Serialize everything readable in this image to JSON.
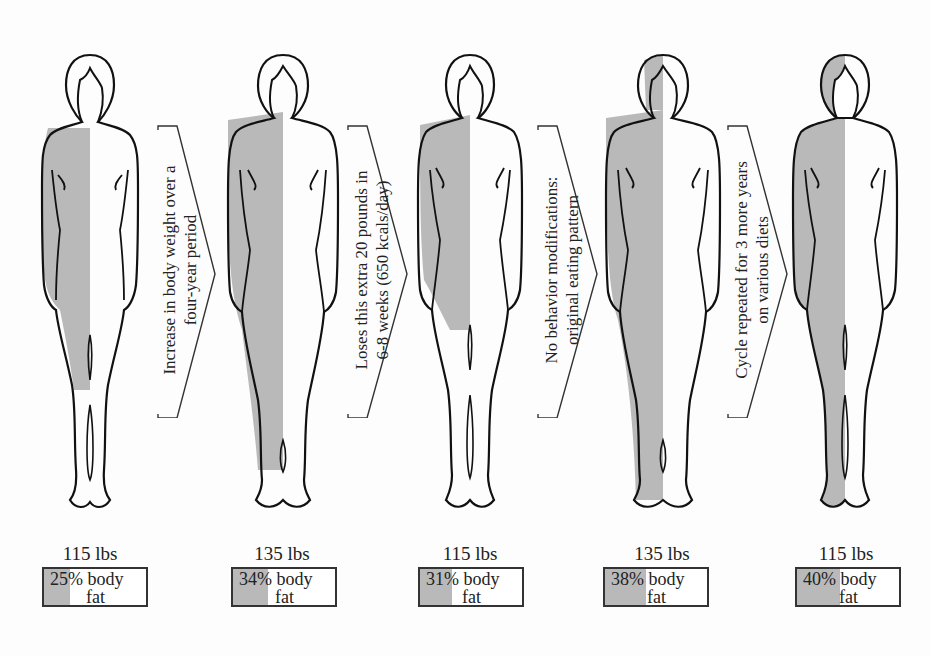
{
  "figures": [
    {
      "weight": "115 lbs",
      "fat_label_line1": "25% body",
      "fat_label_line2": "fat",
      "body_fat_pct": 25
    },
    {
      "weight": "135 lbs",
      "fat_label_line1": "34% body",
      "fat_label_line2": "fat",
      "body_fat_pct": 34
    },
    {
      "weight": "115 lbs",
      "fat_label_line1": "31% body",
      "fat_label_line2": "fat",
      "body_fat_pct": 31
    },
    {
      "weight": "135 lbs",
      "fat_label_line1": "38% body",
      "fat_label_line2": "fat",
      "body_fat_pct": 38
    },
    {
      "weight": "115 lbs",
      "fat_label_line1": "40% body",
      "fat_label_line2": "fat",
      "body_fat_pct": 40
    }
  ],
  "arrows": [
    {
      "line1": "Increase in body weight over a",
      "line2": "four-year period"
    },
    {
      "line1": "Loses this extra 20 pounds in",
      "line2": "6-8 weeks (650 kcals/day)"
    },
    {
      "line1": "No behavior modifications:",
      "line2": "original eating pattern"
    },
    {
      "line1": "Cycle repeated for 3 more years",
      "line2": "on various diets"
    }
  ],
  "colors": {
    "fat_shading": "#b9b9b9",
    "outline": "#111111",
    "background": "#fdfdfd"
  }
}
